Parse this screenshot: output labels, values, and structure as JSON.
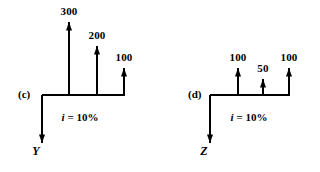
{
  "figure": {
    "background_color": "#ffffff",
    "ink_color": "#000000",
    "panels": [
      {
        "tag": "(c)",
        "tag_x": 18,
        "tag_y": 89,
        "axis_label": "Y",
        "axis_label_x": 36,
        "axis_label_y": 145,
        "interest_rate": "i = 10%",
        "interest_rate_prefix": "i",
        "interest_rate_suffix": " = 10%",
        "interest_rate_x": 80,
        "interest_rate_y": 112,
        "baseline_y": 95,
        "baseline_x_start": 42,
        "baseline_x_end": 125,
        "down_arrow_x": 42,
        "down_arrow_tip_y": 143,
        "cash_flows": [
          {
            "label": "300",
            "x": 69,
            "tip_y": 22,
            "label_y": 6
          },
          {
            "label": "200",
            "x": 97,
            "tip_y": 46,
            "label_y": 30
          },
          {
            "label": "100",
            "x": 124,
            "tip_y": 68,
            "label_y": 52
          }
        ]
      },
      {
        "tag": "(d)",
        "tag_x": 188,
        "tag_y": 89,
        "axis_label": "Z",
        "axis_label_x": 204,
        "axis_label_y": 145,
        "interest_rate": "i = 10%",
        "interest_rate_prefix": "i",
        "interest_rate_suffix": " = 10%",
        "interest_rate_x": 249,
        "interest_rate_y": 112,
        "baseline_y": 95,
        "baseline_x_start": 210,
        "baseline_x_end": 290,
        "down_arrow_x": 210,
        "down_arrow_tip_y": 143,
        "cash_flows": [
          {
            "label": "100",
            "x": 238,
            "tip_y": 68,
            "label_y": 52
          },
          {
            "label": "50",
            "x": 263,
            "tip_y": 79,
            "label_y": 63
          },
          {
            "label": "100",
            "x": 289,
            "tip_y": 68,
            "label_y": 52
          }
        ]
      }
    ]
  }
}
